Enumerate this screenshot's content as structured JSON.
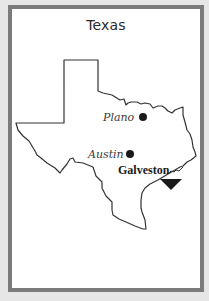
{
  "title": "Texas",
  "map": {
    "state": "Texas",
    "outline_color": "#333333",
    "marker_color": "#1a1a1a",
    "cities": [
      {
        "name": "Plano",
        "style": "italic",
        "marker": "dot"
      },
      {
        "name": "Austin",
        "style": "italic",
        "marker": "dot"
      },
      {
        "name": "Galveston",
        "style": "bold",
        "marker": "triangle"
      }
    ]
  },
  "colors": {
    "frame": "#7b7b7b",
    "background": "#e6e6e6",
    "card": "#ffffff"
  }
}
